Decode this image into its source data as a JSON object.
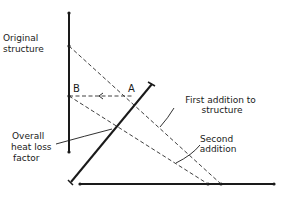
{
  "diagram": {
    "labels": {
      "original_structure_line1": "Original",
      "original_structure_line2": "structure",
      "point_a": "A",
      "point_b": "B",
      "first_addition_line1": "First addition to",
      "first_addition_line2": "structure",
      "second_addition_line1": "Second",
      "second_addition_line2": "addition",
      "overall_factor_line1": "Overall",
      "overall_factor_line2": "heat loss",
      "overall_factor_line3": "factor"
    },
    "colors": {
      "line": "#1a1a1a",
      "dashed": "#2a2a2a",
      "background": "#ffffff"
    }
  }
}
